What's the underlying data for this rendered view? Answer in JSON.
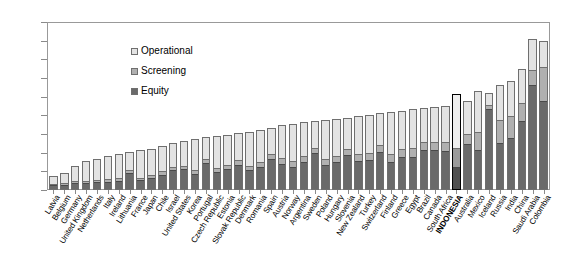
{
  "chart_data": {
    "type": "bar",
    "subtype": "stacked-bar",
    "title": "",
    "xlabel": "",
    "ylabel": "",
    "ylim": [
      0.0,
      0.45
    ],
    "ytick_labels": [
      "0.00",
      "0.05",
      "0.10",
      "0.15",
      "0.20",
      "0.25",
      "0.30",
      "0.35",
      "0.40",
      "0.45"
    ],
    "ytick_values": [
      0.0,
      0.05,
      0.1,
      0.15,
      0.2,
      0.25,
      0.3,
      0.35,
      0.4,
      0.45
    ],
    "grid": false,
    "legend_position": "upper-left-inside",
    "legend": [
      "Operational",
      "Screening",
      "Equity"
    ],
    "series": [
      {
        "name": "Equity",
        "color": "#6a6a6a",
        "values": [
          0.012,
          0.013,
          0.017,
          0.018,
          0.019,
          0.021,
          0.023,
          0.045,
          0.024,
          0.03,
          0.04,
          0.052,
          0.055,
          0.043,
          0.072,
          0.047,
          0.055,
          0.068,
          0.052,
          0.06,
          0.084,
          0.07,
          0.062,
          0.075,
          0.099,
          0.066,
          0.074,
          0.093,
          0.076,
          0.08,
          0.101,
          0.074,
          0.089,
          0.088,
          0.108,
          0.106,
          0.103,
          0.06,
          0.124,
          0.106,
          0.219,
          0.125,
          0.138,
          0.185,
          0.281,
          0.238
        ]
      },
      {
        "name": "Screening",
        "color": "#b0b0b0",
        "values": [
          0.004,
          0.005,
          0.006,
          0.006,
          0.006,
          0.007,
          0.007,
          0.008,
          0.008,
          0.01,
          0.009,
          0.01,
          0.01,
          0.01,
          0.011,
          0.012,
          0.012,
          0.012,
          0.013,
          0.014,
          0.013,
          0.015,
          0.016,
          0.016,
          0.015,
          0.018,
          0.018,
          0.017,
          0.019,
          0.02,
          0.019,
          0.022,
          0.022,
          0.024,
          0.022,
          0.024,
          0.026,
          0.052,
          0.028,
          0.05,
          0.012,
          0.064,
          0.06,
          0.05,
          0.042,
          0.092
        ]
      },
      {
        "name": "Operational",
        "color": "#e3e3e3",
        "values": [
          0.022,
          0.028,
          0.042,
          0.053,
          0.057,
          0.063,
          0.066,
          0.048,
          0.074,
          0.071,
          0.069,
          0.063,
          0.066,
          0.084,
          0.059,
          0.086,
          0.081,
          0.072,
          0.091,
          0.088,
          0.069,
          0.088,
          0.099,
          0.09,
          0.07,
          0.103,
          0.098,
          0.083,
          0.103,
          0.102,
          0.086,
          0.114,
          0.101,
          0.105,
          0.09,
          0.092,
          0.097,
          0.146,
          0.087,
          0.108,
          0.029,
          0.092,
          0.094,
          0.09,
          0.082,
          0.07
        ]
      }
    ],
    "categories": [
      "Latvia",
      "Belgium",
      "Germany",
      "United Kingdom",
      "Netherlands",
      "Italy",
      "Ireland",
      "Lithuania",
      "France",
      "Japan",
      "Chile",
      "Israel",
      "United States",
      "Korea",
      "Portugal",
      "Czech Republic",
      "Estonia",
      "Slovak Republic",
      "Denmark",
      "Romania",
      "Spain",
      "Austria",
      "Norway",
      "Argentina",
      "Sweden",
      "Poland",
      "Hungary",
      "Slovenia",
      "New Zealand",
      "Turkey",
      "Switzerland",
      "Finland",
      "Greece",
      "Egypt",
      "Brazil",
      "Canada",
      "South Africa",
      "INDONESIA",
      "Australia",
      "Mexico",
      "Iceland",
      "Russia",
      "India",
      "China",
      "Saudi Arabia",
      "Colombia"
    ],
    "highlighted_category": "INDONESIA"
  }
}
